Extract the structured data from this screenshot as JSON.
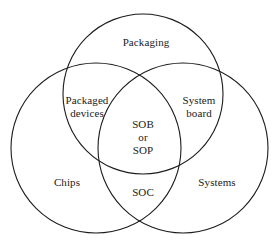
{
  "diagram": {
    "type": "venn",
    "set_count": 3,
    "background_color": "#ffffff",
    "stroke_color": "#1c1c1c",
    "text_color": "#1a1a1a",
    "sets": [
      {
        "id": "packaging",
        "label": "Packaging",
        "cx": 143,
        "cy": 94,
        "r": 80
      },
      {
        "id": "chips",
        "label": "Chips",
        "cx": 96,
        "cy": 148,
        "r": 85
      },
      {
        "id": "systems",
        "label": "Systems",
        "cx": 183,
        "cy": 148,
        "r": 85
      }
    ],
    "regions": [
      {
        "id": "packaging-only",
        "members": [
          "packaging"
        ],
        "label": "Packaging",
        "lines": [
          "Packaging"
        ]
      },
      {
        "id": "chips-only",
        "members": [
          "chips"
        ],
        "label": "Chips",
        "lines": [
          "Chips"
        ]
      },
      {
        "id": "systems-only",
        "members": [
          "systems"
        ],
        "label": "Systems",
        "lines": [
          "Systems"
        ]
      },
      {
        "id": "packaging-chips",
        "members": [
          "packaging",
          "chips"
        ],
        "label": "Packaged devices",
        "lines": [
          "Packaged",
          "devices"
        ]
      },
      {
        "id": "packaging-systems",
        "members": [
          "packaging",
          "systems"
        ],
        "label": "System board",
        "lines": [
          "System",
          "board"
        ]
      },
      {
        "id": "chips-systems",
        "members": [
          "chips",
          "systems"
        ],
        "label": "SOC",
        "lines": [
          "SOC"
        ]
      },
      {
        "id": "all-three",
        "members": [
          "packaging",
          "chips",
          "systems"
        ],
        "label": "SOB or SOP",
        "lines": [
          "SOB",
          "or",
          "SOP"
        ]
      }
    ]
  },
  "labels": {
    "packaging": "Packaging",
    "packaged_devices_line1": "Packaged",
    "packaged_devices_line2": "devices",
    "system_board_line1": "System",
    "system_board_line2": "board",
    "center_line1": "SOB",
    "center_line2": "or",
    "center_line3": "SOP",
    "chips": "Chips",
    "soc": "SOC",
    "systems": "Systems"
  }
}
